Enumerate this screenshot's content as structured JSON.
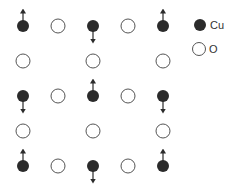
{
  "diagram": {
    "type": "lattice",
    "colors": {
      "cu_fill": "#2b2b2b",
      "o_stroke": "#555555",
      "arrow": "#2b2b2b"
    },
    "atoms": [
      {
        "species": "Cu",
        "row": 0,
        "col": 0,
        "spin": "up"
      },
      {
        "species": "O",
        "row": 0,
        "col": 1
      },
      {
        "species": "Cu",
        "row": 0,
        "col": 2,
        "spin": "down"
      },
      {
        "species": "O",
        "row": 0,
        "col": 3
      },
      {
        "species": "Cu",
        "row": 0,
        "col": 4,
        "spin": "up"
      },
      {
        "species": "O",
        "row": 1,
        "col": 0
      },
      {
        "species": "O",
        "row": 1,
        "col": 2
      },
      {
        "species": "O",
        "row": 1,
        "col": 4
      },
      {
        "species": "Cu",
        "row": 2,
        "col": 0,
        "spin": "down"
      },
      {
        "species": "O",
        "row": 2,
        "col": 1
      },
      {
        "species": "Cu",
        "row": 2,
        "col": 2,
        "spin": "up"
      },
      {
        "species": "O",
        "row": 2,
        "col": 3
      },
      {
        "species": "Cu",
        "row": 2,
        "col": 4,
        "spin": "down"
      },
      {
        "species": "O",
        "row": 3,
        "col": 0
      },
      {
        "species": "O",
        "row": 3,
        "col": 2
      },
      {
        "species": "O",
        "row": 3,
        "col": 4
      },
      {
        "species": "Cu",
        "row": 4,
        "col": 0,
        "spin": "up"
      },
      {
        "species": "O",
        "row": 4,
        "col": 1
      },
      {
        "species": "Cu",
        "row": 4,
        "col": 2,
        "spin": "down"
      },
      {
        "species": "O",
        "row": 4,
        "col": 3
      },
      {
        "species": "Cu",
        "row": 4,
        "col": 4,
        "spin": "up"
      }
    ]
  },
  "legend": {
    "items": [
      {
        "symbol": "filled-circle",
        "label": "Cu"
      },
      {
        "symbol": "open-circle",
        "label": "O"
      }
    ]
  }
}
